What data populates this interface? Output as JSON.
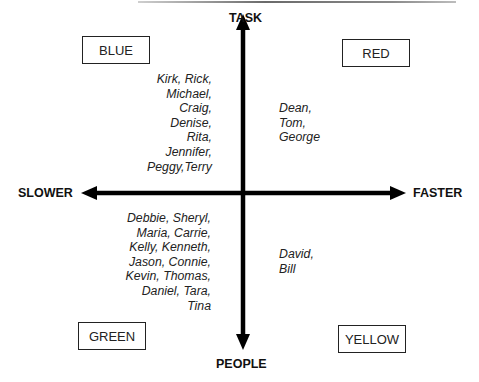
{
  "axes": {
    "top": "TASK",
    "bottom": "PEOPLE",
    "left": "SLOWER",
    "right": "FASTER"
  },
  "quadrants": [
    {
      "id": "top-left",
      "label": "BLUE",
      "names": [
        "Kirk, Rick,",
        "Michael,",
        "Craig,",
        "Denise,",
        "Rita,",
        "Jennifer,",
        "Peggy,Terry"
      ]
    },
    {
      "id": "top-right",
      "label": "RED",
      "names": [
        "Dean,",
        "Tom,",
        "George"
      ]
    },
    {
      "id": "bottom-left",
      "label": "GREEN",
      "names": [
        "Debbie, Sheryl,",
        "Maria, Carrie,",
        "Kelly, Kenneth,",
        "Jason, Connie,",
        "Kevin, Thomas,",
        "Daniel, Tara,",
        "Tina"
      ]
    },
    {
      "id": "bottom-right",
      "label": "YELLOW",
      "names": [
        "David,",
        "Bill"
      ]
    }
  ],
  "text": {
    "blue_label": "BLUE",
    "red_label": "RED",
    "green_label": "GREEN",
    "yellow_label": "YELLOW",
    "blue_names": "Kirk, Rick,\nMichael,\nCraig,\nDenise,\nRita,\nJennifer,\nPeggy,Terry",
    "red_names": "Dean,\nTom,\nGeorge",
    "green_names": "Debbie, Sheryl,\nMaria, Carrie,\nKelly, Kenneth,\nJason, Connie,\nKevin, Thomas,\nDaniel, Tara,\nTina",
    "yellow_names": "David,\nBill"
  }
}
